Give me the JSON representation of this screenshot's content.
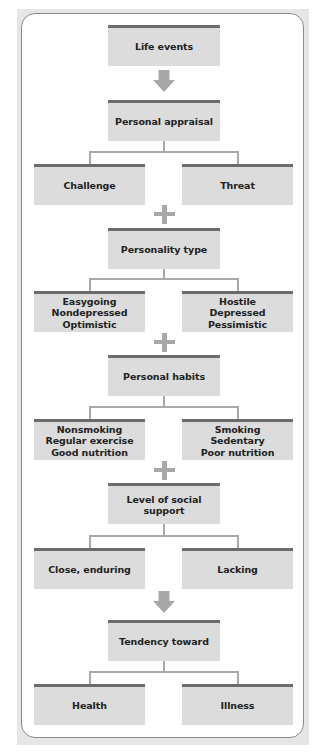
{
  "diagram": {
    "colors": {
      "box_fill": "#dcdcdc",
      "box_top_border": "#6b6b6b",
      "connector": "#a9a9a9",
      "symbol": "#a8a8a8",
      "panel_border": "#8a8a8a",
      "outer_background": "#e6e6e6"
    },
    "nodes": {
      "life_events": "Life events",
      "personal_appraisal": "Personal appraisal",
      "challenge": "Challenge",
      "threat": "Threat",
      "personality_type": "Personality type",
      "personality_left": [
        "Easygoing",
        "Nondepressed",
        "Optimistic"
      ],
      "personality_right": [
        "Hostile",
        "Depressed",
        "Pessimistic"
      ],
      "personal_habits": "Personal habits",
      "habits_left": [
        "Nonsmoking",
        "Regular exercise",
        "Good nutrition"
      ],
      "habits_right": [
        "Smoking",
        "Sedentary",
        "Poor nutrition"
      ],
      "social_support": "Level of social support",
      "support_left": "Close, enduring",
      "support_right": "Lacking",
      "tendency": "Tendency toward",
      "health": "Health",
      "illness": "Illness"
    },
    "connectors": [
      {
        "from": "life_events",
        "to": "personal_appraisal",
        "symbol": "arrow-down"
      },
      {
        "from": "personal_appraisal",
        "to": [
          "challenge",
          "threat"
        ],
        "symbol": "branch"
      },
      {
        "from": [
          "challenge",
          "threat"
        ],
        "to": "personality_type",
        "symbol": "plus"
      },
      {
        "from": "personality_type",
        "to": [
          "personality_left",
          "personality_right"
        ],
        "symbol": "branch"
      },
      {
        "from": [
          "personality_left",
          "personality_right"
        ],
        "to": "personal_habits",
        "symbol": "plus"
      },
      {
        "from": "personal_habits",
        "to": [
          "habits_left",
          "habits_right"
        ],
        "symbol": "branch"
      },
      {
        "from": [
          "habits_left",
          "habits_right"
        ],
        "to": "social_support",
        "symbol": "plus"
      },
      {
        "from": "social_support",
        "to": [
          "support_left",
          "support_right"
        ],
        "symbol": "branch"
      },
      {
        "from": [
          "support_left",
          "support_right"
        ],
        "to": "tendency",
        "symbol": "arrow-down"
      },
      {
        "from": "tendency",
        "to": [
          "health",
          "illness"
        ],
        "symbol": "branch"
      }
    ]
  }
}
